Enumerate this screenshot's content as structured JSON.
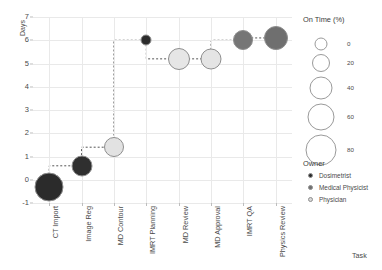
{
  "chart_data": {
    "type": "scatter",
    "title": "",
    "xlabel": "Task",
    "ylabel": "Days",
    "categories": [
      "CT Import",
      "Image Reg",
      "MD Contour",
      "IMRT Planning",
      "MD Review",
      "MD Approval",
      "IMRT QA",
      "Physics Review"
    ],
    "ylim": [
      -1,
      7
    ],
    "yticks": [
      "7",
      "6",
      "5",
      "4",
      "3",
      "2",
      "1",
      "0",
      "-1"
    ],
    "ytick_values": [
      7,
      6,
      5,
      4,
      3,
      2,
      1,
      0,
      -1
    ],
    "grid": true,
    "legend_position": "right",
    "points": [
      {
        "task": "CT Import",
        "days": -0.3,
        "on_time": 78,
        "owner": "Dosimetrist",
        "color": "#2b2b2b",
        "size": 29
      },
      {
        "task": "Image Reg",
        "days": 0.6,
        "on_time": 44,
        "owner": "Dosimetrist",
        "color": "#2f2f2f",
        "size": 21
      },
      {
        "task": "MD Contour",
        "days": 1.4,
        "on_time": 38,
        "owner": "Physician",
        "color": "#e2e2e2",
        "size": 20
      },
      {
        "task": "IMRT Planning",
        "days": 6.0,
        "on_time": 6,
        "owner": "Medical Physicist",
        "color": "#2b2b2b",
        "size": 11
      },
      {
        "task": "MD Review",
        "days": 5.2,
        "on_time": 46,
        "owner": "Physician",
        "color": "#e6e6e6",
        "size": 22
      },
      {
        "task": "MD Approval",
        "days": 5.2,
        "on_time": 44,
        "owner": "Physician",
        "color": "#e4e4e4",
        "size": 21
      },
      {
        "task": "IMRT QA",
        "days": 6.0,
        "on_time": 40,
        "owner": "Medical Physicist",
        "color": "#767676",
        "size": 20
      },
      {
        "task": "Physics Review",
        "days": 6.1,
        "on_time": 52,
        "owner": "Medical Physicist",
        "color": "#6f6f6f",
        "size": 24
      }
    ],
    "connector": {
      "style": "dashed",
      "color": "#555555"
    },
    "size_legend": {
      "title": "On Time (%)",
      "entries": [
        {
          "label": "0",
          "size": 13
        },
        {
          "label": "20",
          "size": 18
        },
        {
          "label": "40",
          "size": 23
        },
        {
          "label": "60",
          "size": 27
        },
        {
          "label": "80",
          "size": 31
        }
      ]
    },
    "owner_legend": {
      "title": "Owner",
      "entries": [
        {
          "label": "Dosimetrist",
          "color": "#2b2b2b"
        },
        {
          "label": "Medical Physicist",
          "color": "#6f6f6f"
        },
        {
          "label": "Physician",
          "color": "#d8d8d8"
        }
      ]
    }
  }
}
